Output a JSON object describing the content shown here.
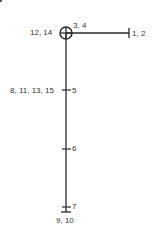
{
  "diagram": {
    "type": "position-tree",
    "colors": {
      "line": "#2a2a2a",
      "text": "#333333",
      "background": "#ffffff"
    },
    "nodes": [
      {
        "id": "origin",
        "symbol": "circle-cross",
        "labels_left": "12, 14",
        "labels_right": "3, 4"
      },
      {
        "id": "right-end",
        "symbol": "end-tick",
        "label": "1, 2"
      },
      {
        "id": "tick-5",
        "symbol": "tick",
        "labels_left": "8, 11, 13, 15",
        "label": "5"
      },
      {
        "id": "tick-6",
        "symbol": "tick",
        "label": "6"
      },
      {
        "id": "tick-7",
        "symbol": "tick",
        "label": "7"
      },
      {
        "id": "bottom-end",
        "symbol": "end-tick",
        "label": "9, 10"
      }
    ]
  },
  "labels": {
    "origin_left": "12, 14",
    "origin_right": "3, 4",
    "right_end": "1, 2",
    "tick5_left": "8, 11, 13, 15",
    "tick5_right": "5",
    "tick6": "6",
    "tick7": "7",
    "bottom_end": "9, 10"
  }
}
